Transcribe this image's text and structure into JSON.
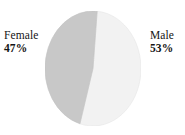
{
  "chart_data": {
    "type": "pie",
    "title": "",
    "subtitle": "",
    "xlabel": "",
    "ylabel": "",
    "grid": false,
    "legend_position": "none",
    "label_style": "outside-callout",
    "start_angle_deg": 5,
    "direction": "clockwise",
    "categories": [
      "Male",
      "Female"
    ],
    "values": [
      53,
      47
    ],
    "unit": "%",
    "slices": [
      {
        "name": "Male",
        "value": 53,
        "value_label": "53%",
        "color": "#f2f2f2",
        "side": "right"
      },
      {
        "name": "Female",
        "value": 47,
        "value_label": "47%",
        "color": "#c8c8c8",
        "side": "left"
      }
    ],
    "colors": [
      "#f2f2f2",
      "#c8c8c8"
    ],
    "total": 100
  },
  "labels": {
    "female": {
      "name": "Female",
      "percent": "47%"
    },
    "male": {
      "name": "Male",
      "percent": "53%"
    }
  },
  "style": {
    "background": "#ffffff",
    "text_color": "#141414",
    "slice_male_color": "#f2f2f2",
    "slice_female_color": "#c8c8c8",
    "slice_edge_color": "#dcdcdc"
  }
}
